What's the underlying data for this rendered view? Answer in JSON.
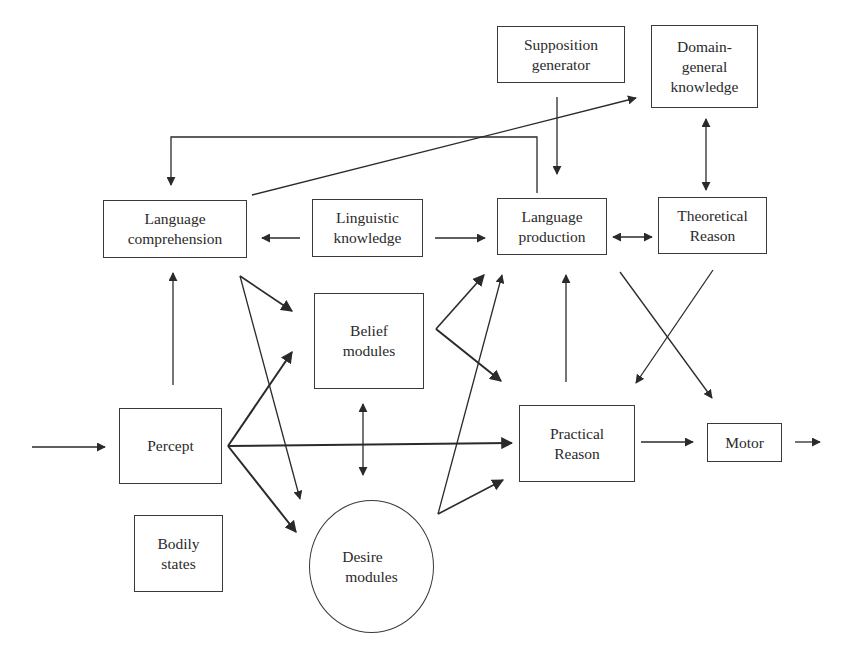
{
  "diagram": {
    "nodes": {
      "supposition_generator": {
        "lines": [
          "Supposition",
          "generator"
        ]
      },
      "domain_general_knowledge": {
        "lines": [
          "Domain-",
          "general",
          "knowledge"
        ]
      },
      "language_comprehension": {
        "lines": [
          "Language",
          "comprehension"
        ]
      },
      "linguistic_knowledge": {
        "lines": [
          "Linguistic",
          "knowledge"
        ]
      },
      "language_production": {
        "lines": [
          "Language",
          "production"
        ]
      },
      "theoretical_reason": {
        "lines": [
          "Theoretical",
          "Reason"
        ]
      },
      "belief_modules": {
        "lines": [
          "Belief",
          "modules"
        ]
      },
      "percept": {
        "lines": [
          "Percept"
        ]
      },
      "practical_reason": {
        "lines": [
          "Practical",
          "Reason"
        ]
      },
      "motor": {
        "lines": [
          "Motor"
        ]
      },
      "bodily_states": {
        "lines": [
          "Bodily",
          "states"
        ]
      },
      "desire_modules": {
        "lines": [
          "Desire",
          "modules"
        ],
        "shape": "circle"
      }
    },
    "edges": [
      {
        "from": "external_input",
        "to": "percept"
      },
      {
        "from": "percept",
        "to": "language_comprehension"
      },
      {
        "from": "percept",
        "to": "belief_modules"
      },
      {
        "from": "percept",
        "to": "practical_reason"
      },
      {
        "from": "percept",
        "to": "desire_modules"
      },
      {
        "from": "language_comprehension",
        "to": "belief_modules"
      },
      {
        "from": "language_comprehension",
        "to": "desire_modules"
      },
      {
        "from": "language_comprehension",
        "to": "domain_general_knowledge"
      },
      {
        "from": "language_production",
        "to": "language_comprehension"
      },
      {
        "from": "linguistic_knowledge",
        "to": "language_comprehension"
      },
      {
        "from": "linguistic_knowledge",
        "to": "language_production"
      },
      {
        "from": "supposition_generator",
        "to": "language_production"
      },
      {
        "from": "language_production",
        "to": "theoretical_reason",
        "bidirectional": true
      },
      {
        "from": "domain_general_knowledge",
        "to": "theoretical_reason",
        "bidirectional": true
      },
      {
        "from": "theoretical_reason",
        "to": "practical_reason"
      },
      {
        "from": "language_production",
        "to": "motor"
      },
      {
        "from": "belief_modules",
        "to": "language_production"
      },
      {
        "from": "belief_modules",
        "to": "practical_reason"
      },
      {
        "from": "belief_modules",
        "to": "desire_modules",
        "bidirectional": true
      },
      {
        "from": "desire_modules",
        "to": "language_production"
      },
      {
        "from": "desire_modules",
        "to": "practical_reason"
      },
      {
        "from": "practical_reason",
        "to": "language_production"
      },
      {
        "from": "practical_reason",
        "to": "motor"
      },
      {
        "from": "bodily_states",
        "to": "desire_modules"
      },
      {
        "from": "motor",
        "to": "external_output"
      }
    ]
  }
}
